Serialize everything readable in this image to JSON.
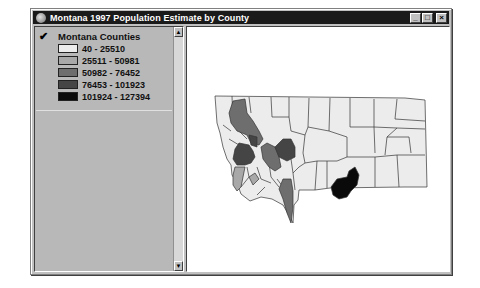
{
  "window": {
    "title": "Montana 1997 Population Estimate by County",
    "controls": {
      "minimize": "_",
      "maximize": "□",
      "close": "×"
    }
  },
  "legend": {
    "layer_visible": true,
    "layer_name": "Montana Counties",
    "classes": [
      {
        "label": "40 - 25510",
        "color": "#ececec"
      },
      {
        "label": "25511 - 50981",
        "color": "#a8a8a8"
      },
      {
        "label": "50982 - 76452",
        "color": "#6e6e6e"
      },
      {
        "label": "76453 - 101923",
        "color": "#454545"
      },
      {
        "label": "101924 - 127394",
        "color": "#0a0a0a"
      }
    ],
    "scroll_up": "▲",
    "scroll_down": "▼"
  },
  "map": {
    "region": "Montana",
    "highlighted_counties": [
      {
        "class": 2,
        "description": "Flathead (northwest)"
      },
      {
        "class": 3,
        "description": "Missoula"
      },
      {
        "class": 1,
        "description": "Ravalli"
      },
      {
        "class": 2,
        "description": "Lewis and Clark"
      },
      {
        "class": 3,
        "description": "Cascade"
      },
      {
        "class": 1,
        "description": "Silver Bow"
      },
      {
        "class": 2,
        "description": "Gallatin"
      },
      {
        "class": 4,
        "description": "Yellowstone"
      }
    ]
  }
}
